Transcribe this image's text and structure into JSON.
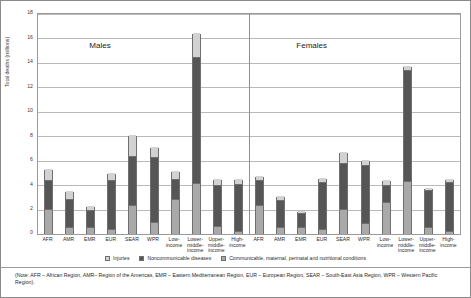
{
  "chart_data": {
    "type": "bar",
    "title": "",
    "xlabel": "",
    "ylabel": "Total deaths (millions)",
    "ylim": [
      0,
      18
    ],
    "ytick_step": 2,
    "yticks": [
      "0",
      "2",
      "4",
      "6",
      "8",
      "10",
      "12",
      "14",
      "16",
      "18"
    ],
    "grid": true,
    "stacked": true,
    "legend_position": "bottom-center",
    "group_labels": [
      "Males",
      "Females"
    ],
    "series": [
      {
        "name": "Communicable, maternal, perinatal and nutritional conditions",
        "color": "#a9a9a9",
        "values": [
          2.0,
          0.5,
          0.55,
          0.3,
          2.3,
          0.9,
          2.8,
          4.1,
          0.6,
          0.2,
          2.3,
          0.5,
          0.5,
          0.3,
          2.0,
          0.8,
          2.6,
          4.3,
          0.5,
          0.2
        ]
      },
      {
        "name": "Noncommunicable diseases",
        "color": "#565656",
        "values": [
          2.3,
          2.3,
          1.3,
          4.0,
          4.0,
          5.3,
          1.6,
          10.3,
          3.3,
          3.8,
          2.0,
          2.2,
          1.1,
          3.9,
          3.7,
          4.8,
          1.3,
          9.0,
          3.0,
          4.0
        ]
      },
      {
        "name": "Injuries",
        "color": "#d2d2d2",
        "values": [
          0.9,
          0.6,
          0.35,
          0.65,
          1.7,
          0.8,
          0.7,
          2.0,
          0.5,
          0.4,
          0.4,
          0.3,
          0.2,
          0.3,
          0.9,
          0.4,
          0.4,
          0.4,
          0.2,
          0.2
        ]
      }
    ],
    "categories": [
      {
        "label": "AFR",
        "group": "Males"
      },
      {
        "label": "AMR",
        "group": "Males"
      },
      {
        "label": "EMR",
        "group": "Males"
      },
      {
        "label": "EUR",
        "group": "Males"
      },
      {
        "label": "SEAR",
        "group": "Males"
      },
      {
        "label": "WPR",
        "group": "Males"
      },
      {
        "label": "Low-income",
        "group": "Males"
      },
      {
        "label": "Lower-middle-income",
        "group": "Males"
      },
      {
        "label": "Upper-middle-income",
        "group": "Males"
      },
      {
        "label": "High-income",
        "group": "Males"
      },
      {
        "label": "AFR",
        "group": "Females"
      },
      {
        "label": "AMR",
        "group": "Females"
      },
      {
        "label": "EMR",
        "group": "Females"
      },
      {
        "label": "EUR",
        "group": "Females"
      },
      {
        "label": "SEAR",
        "group": "Females"
      },
      {
        "label": "WPR",
        "group": "Females"
      },
      {
        "label": "Low-income",
        "group": "Females"
      },
      {
        "label": "Lower-middle-income",
        "group": "Females"
      },
      {
        "label": "Upper-middle-income",
        "group": "Females"
      },
      {
        "label": "High-income",
        "group": "Females"
      }
    ],
    "totals": [
      5.2,
      3.4,
      2.2,
      4.95,
      8.0,
      7.0,
      4.1,
      16.4,
      4.4,
      4.4,
      4.7,
      3.0,
      1.8,
      4.5,
      6.6,
      6.0,
      4.3,
      13.7,
      3.7,
      4.4
    ]
  },
  "axis": {
    "y_title": "Total deaths (millions)",
    "y_ticks": [
      "18",
      "16",
      "14",
      "12",
      "10",
      "8",
      "6",
      "4",
      "2",
      "0"
    ]
  },
  "groups": {
    "males_label": "Males",
    "females_label": "Females"
  },
  "legend": {
    "items": [
      {
        "label": "Injuries",
        "color": "#d2d2d2"
      },
      {
        "label": "Noncommunicable diseases",
        "color": "#565656"
      },
      {
        "label": "Communicable, maternal, perinatal and nutritional conditions",
        "color": "#a9a9a9"
      }
    ]
  },
  "note": {
    "text": "(Note: AFR – African Region, AMR– Region of the Americas, EMR – Eastern Mediterranean Region, EUR – European Region, SEAR – South-East Asia Region, WPR – Western Pacific Region)."
  }
}
